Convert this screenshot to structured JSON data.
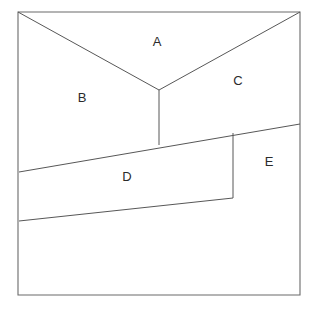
{
  "figure": {
    "background_color": "#ffffff",
    "line_color": "#575757",
    "outline_color": "#6a6a6a",
    "label_color": "#2b2b2b",
    "canvas": {
      "width": 315,
      "height": 314
    },
    "outline": {
      "name": "square-border",
      "points": "18,12 300,12 300,295 18,295"
    },
    "regions": [
      {
        "id": "A",
        "label": "A",
        "label_x": 157,
        "label_y": 43,
        "outline_points": "18,12 300,12 159,90"
      },
      {
        "id": "B",
        "label": "B",
        "label_x": 82,
        "label_y": 99,
        "outline_points": "18,12 159,90 159,145 19,172"
      },
      {
        "id": "C",
        "label": "C",
        "label_x": 238,
        "label_y": 82,
        "outline_points": "159,90 300,12 300,124 159,145"
      },
      {
        "id": "D",
        "label": "D",
        "label_x": 127,
        "label_y": 178,
        "outline_points": "19,172 159,145 233,133 233,198 19,221"
      },
      {
        "id": "E",
        "label": "E",
        "label_x": 269,
        "label_y": 163,
        "outline_points": "233,133 300,124 300,295 233,198"
      }
    ],
    "internal_lines": [
      {
        "name": "edge-topleft-to-vertex",
        "x1": 18,
        "y1": 12,
        "x2": 159,
        "y2": 90
      },
      {
        "name": "edge-topright-to-vertex",
        "x1": 300,
        "y1": 12,
        "x2": 159,
        "y2": 90
      },
      {
        "name": "edge-vertex-stem",
        "x1": 159,
        "y1": 90,
        "x2": 159,
        "y2": 145
      },
      {
        "name": "edge-upper-diagonal",
        "x1": 19,
        "y1": 172,
        "x2": 300,
        "y2": 124
      },
      {
        "name": "edge-lower-diagonal",
        "x1": 19,
        "y1": 221,
        "x2": 233,
        "y2": 198
      },
      {
        "name": "edge-d-right-vertical",
        "x1": 233,
        "y1": 133,
        "x2": 233,
        "y2": 198
      }
    ]
  }
}
